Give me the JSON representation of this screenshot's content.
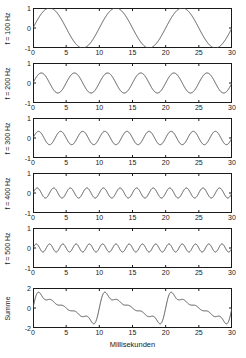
{
  "figure": {
    "xaxis_title": "Millisekunden",
    "x_ticks": [
      0,
      5,
      10,
      15,
      20,
      25,
      30
    ],
    "xlim": [
      0,
      30
    ]
  },
  "chart_data": {
    "type": "line",
    "title": "",
    "xlabel": "Millisekunden",
    "ylabel": "",
    "xlim": [
      0,
      30
    ],
    "x_ticks": [
      0,
      5,
      10,
      15,
      20,
      25,
      30
    ],
    "grid": false,
    "legend": "none",
    "panels": [
      {
        "label": "f = 100 Hz",
        "frequency_hz": 100,
        "amplitude": 1.0,
        "phase": 0,
        "cycles": 3,
        "ylim": [
          -1,
          1
        ],
        "y_ticks": [
          1,
          0,
          -1
        ]
      },
      {
        "label": "f = 200 Hz",
        "frequency_hz": 200,
        "amplitude": 0.5,
        "phase": 0,
        "cycles": 6,
        "ylim": [
          -1,
          1
        ],
        "y_ticks": [
          1,
          0,
          -1
        ]
      },
      {
        "label": "f = 300 Hz",
        "frequency_hz": 300,
        "amplitude": 0.3333,
        "phase": 0,
        "cycles": 9,
        "ylim": [
          -1,
          1
        ],
        "y_ticks": [
          1,
          0,
          -1
        ]
      },
      {
        "label": "f = 400 Hz",
        "frequency_hz": 400,
        "amplitude": 0.25,
        "phase": 0,
        "cycles": 12,
        "ylim": [
          -1,
          1
        ],
        "y_ticks": [
          1,
          0,
          -1
        ]
      },
      {
        "label": "f = 500 Hz",
        "frequency_hz": 500,
        "amplitude": 0.2,
        "phase": 0,
        "cycles": 15,
        "ylim": [
          -1,
          1
        ],
        "y_ticks": [
          1,
          0,
          -1
        ]
      },
      {
        "label": "Summe",
        "frequency_hz": 100,
        "is_sum": true,
        "sum_of_harmonics": [
          1,
          2,
          3,
          4,
          5
        ],
        "cycles": 3,
        "ylim": [
          -2,
          2
        ],
        "y_ticks": [
          2,
          0,
          -2
        ]
      }
    ],
    "colors": {
      "line": "#4d4d4d",
      "axis": "#1a1a1a",
      "background": "#ffffff"
    }
  }
}
